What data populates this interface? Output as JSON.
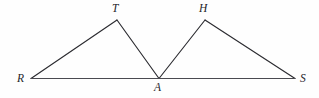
{
  "figure": {
    "kind": "geometry-diagram",
    "canvas": {
      "width": 319,
      "height": 98,
      "background": "#fefefe"
    },
    "stroke_color": "#2b2b30",
    "baseline_color": "#4a4a50",
    "label_color": "#24242a",
    "vertices": [
      {
        "id": "R",
        "label": "R",
        "x": 31,
        "y": 78.5,
        "label_x": 17,
        "label_y": 73
      },
      {
        "id": "T",
        "label": "T",
        "x": 117,
        "y": 20,
        "label_x": 112,
        "label_y": 3
      },
      {
        "id": "A",
        "label": "A",
        "x": 159,
        "y": 78.5,
        "label_x": 154,
        "label_y": 82
      },
      {
        "id": "H",
        "label": "H",
        "x": 205,
        "y": 20,
        "label_x": 199,
        "label_y": 3
      },
      {
        "id": "S",
        "label": "S",
        "x": 295,
        "y": 78.5,
        "label_x": 300,
        "label_y": 73
      }
    ],
    "edges": [
      {
        "id": "RT",
        "from": "R",
        "to": "T",
        "path": "M 31 78.5 L 117 20"
      },
      {
        "id": "TA",
        "from": "T",
        "to": "A",
        "path": "M 117 20 L 159 78.5"
      },
      {
        "id": "AH",
        "from": "A",
        "to": "H",
        "path": "M 159 78.5 L 205 20"
      },
      {
        "id": "HS",
        "from": "H",
        "to": "S",
        "path": "M 205 20 L 295 78.5"
      },
      {
        "id": "RS",
        "from": "R",
        "to": "S",
        "path": "M 31 78.5 L 295 78.5"
      }
    ]
  }
}
